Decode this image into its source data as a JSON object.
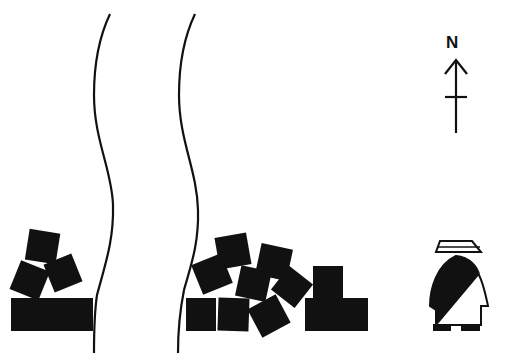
{
  "diagram": {
    "compass": {
      "label": "N",
      "direction": "north",
      "icon": "north-arrow-icon"
    },
    "river": {
      "description": "river channel drawn with two wavy bank lines",
      "color": "#111111"
    },
    "west_bank": {
      "description": "stacked blocks: base slab with three tilted blocks"
    },
    "east_bank": {
      "description": "jumbled tilted blocks and L-shaped stack"
    },
    "figure": {
      "description": "standing person with brimmed hat and diagonal-draped garment",
      "icon": "person-icon"
    },
    "colors": {
      "ink": "#111111",
      "background": "#ffffff"
    }
  }
}
